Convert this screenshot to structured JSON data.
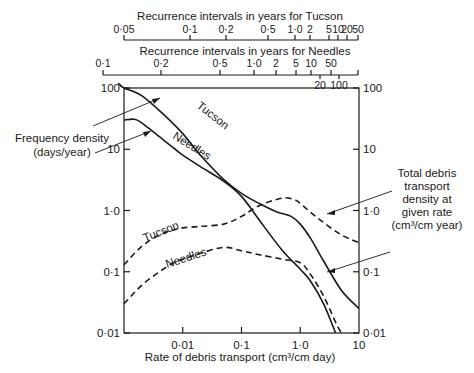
{
  "chart_data": {
    "type": "line",
    "title": "",
    "xlabel": "Rate of debris transport (cm³/cm day)",
    "ylabel_left": "Frequency density (days/year)",
    "ylabel_right": "Total debris transport density at given rate (cm³/cm year)",
    "xscale": "log",
    "yscale": "log",
    "xlim": [
      0.001,
      10
    ],
    "ylim": [
      0.01,
      100
    ],
    "grid": false,
    "x_ticks": [
      {
        "value": 0.01,
        "label": "0·01"
      },
      {
        "value": 0.1,
        "label": "0·1"
      },
      {
        "value": 1.0,
        "label": "1·0"
      },
      {
        "value": 10,
        "label": "10"
      }
    ],
    "y_ticks_left": [
      {
        "value": 100,
        "label": "100"
      },
      {
        "value": 10,
        "label": "10"
      },
      {
        "value": 1.0,
        "label": "1·0"
      },
      {
        "value": 0.1,
        "label": "0·1"
      },
      {
        "value": 0.01,
        "label": "0·01"
      }
    ],
    "y_ticks_right": [
      {
        "value": 100,
        "label": "100"
      },
      {
        "value": 10,
        "label": "10"
      },
      {
        "value": 1.0,
        "label": "1·0"
      },
      {
        "value": 0.1,
        "label": "0·1"
      },
      {
        "value": 0.01,
        "label": "0·01"
      }
    ],
    "top_axes": [
      {
        "title": "Recurrence intervals in years for Tucson",
        "ticks": [
          {
            "label": "0·05",
            "x": 124
          },
          {
            "label": "0·1",
            "x": 190
          },
          {
            "label": "0·2",
            "x": 226
          },
          {
            "label": "0·5",
            "x": 268
          },
          {
            "label": "1·0",
            "x": 295
          },
          {
            "label": "2",
            "x": 310
          },
          {
            "label": "5",
            "x": 329
          },
          {
            "label": "10",
            "x": 338
          },
          {
            "label": "20",
            "x": 347
          },
          {
            "label": "50",
            "x": 358
          }
        ]
      },
      {
        "title": "Recurrence intervals in years for Needles",
        "ticks": [
          {
            "label": "0·1",
            "x": 103,
            "pos": "above"
          },
          {
            "label": "0·2",
            "x": 161,
            "pos": "above"
          },
          {
            "label": "0·5",
            "x": 220,
            "pos": "above"
          },
          {
            "label": "1·0",
            "x": 254,
            "pos": "above"
          },
          {
            "label": "2",
            "x": 276,
            "pos": "above"
          },
          {
            "label": "5",
            "x": 296,
            "pos": "above"
          },
          {
            "label": "10",
            "x": 311,
            "pos": "above"
          },
          {
            "label": "20",
            "x": 320,
            "pos": "below"
          },
          {
            "label": "50",
            "x": 331,
            "pos": "above"
          },
          {
            "label": "100",
            "x": 339,
            "pos": "below"
          }
        ]
      }
    ],
    "series": [
      {
        "name": "Tucson",
        "group": "Frequency density",
        "style": "solid",
        "points": [
          [
            0.0008,
            120
          ],
          [
            0.001,
            100
          ],
          [
            0.002,
            75
          ],
          [
            0.005,
            35
          ],
          [
            0.01,
            18
          ],
          [
            0.02,
            8
          ],
          [
            0.05,
            3.2
          ],
          [
            0.1,
            1.9
          ],
          [
            0.2,
            1.3
          ],
          [
            0.4,
            0.95
          ],
          [
            0.7,
            0.8
          ],
          [
            1.0,
            0.6
          ],
          [
            1.5,
            0.35
          ],
          [
            2.5,
            0.15
          ],
          [
            5,
            0.05
          ],
          [
            10,
            0.025
          ]
        ]
      },
      {
        "name": "Needles",
        "group": "Frequency density",
        "style": "solid",
        "points": [
          [
            0.001,
            30
          ],
          [
            0.0015,
            31
          ],
          [
            0.002,
            27
          ],
          [
            0.004,
            16
          ],
          [
            0.007,
            10.5
          ],
          [
            0.01,
            8
          ],
          [
            0.02,
            5.2
          ],
          [
            0.05,
            3
          ],
          [
            0.1,
            1.7
          ],
          [
            0.2,
            0.7
          ],
          [
            0.5,
            0.22
          ],
          [
            1.0,
            0.11
          ],
          [
            1.5,
            0.07
          ],
          [
            2.5,
            0.03
          ],
          [
            4,
            0.01
          ]
        ]
      },
      {
        "name": "Tucson",
        "group": "Total debris transport density",
        "style": "dashed",
        "points": [
          [
            0.001,
            0.13
          ],
          [
            0.002,
            0.26
          ],
          [
            0.004,
            0.4
          ],
          [
            0.007,
            0.48
          ],
          [
            0.01,
            0.52
          ],
          [
            0.02,
            0.55
          ],
          [
            0.05,
            0.6
          ],
          [
            0.1,
            0.8
          ],
          [
            0.2,
            1.2
          ],
          [
            0.5,
            1.6
          ],
          [
            0.8,
            1.5
          ],
          [
            1.0,
            1.3
          ],
          [
            2,
            0.75
          ],
          [
            5,
            0.4
          ],
          [
            10,
            0.3
          ]
        ]
      },
      {
        "name": "Needles",
        "group": "Total debris transport density",
        "style": "dashed",
        "points": [
          [
            0.001,
            0.03
          ],
          [
            0.002,
            0.06
          ],
          [
            0.004,
            0.1
          ],
          [
            0.007,
            0.14
          ],
          [
            0.01,
            0.16
          ],
          [
            0.02,
            0.2
          ],
          [
            0.05,
            0.25
          ],
          [
            0.1,
            0.22
          ],
          [
            0.2,
            0.19
          ],
          [
            0.5,
            0.16
          ],
          [
            1.0,
            0.14
          ],
          [
            1.5,
            0.09
          ],
          [
            2.5,
            0.04
          ],
          [
            4,
            0.015
          ],
          [
            5,
            0.01
          ]
        ]
      }
    ],
    "annotations": {
      "left_label_line1": "Frequency density",
      "left_label_line2": "(days/year)",
      "right_label_lines": [
        "Total debris",
        "transport",
        "density at",
        "given rate",
        "(cm³/cm year)"
      ],
      "curve_labels": [
        {
          "text": "Tucson",
          "x": 196,
          "y": 107,
          "rotate": 38
        },
        {
          "text": "Needles",
          "x": 172,
          "y": 138,
          "rotate": 32
        },
        {
          "text": "Tucson",
          "x": 145,
          "y": 242,
          "rotate": -22
        },
        {
          "text": "Needles",
          "x": 167,
          "y": 268,
          "rotate": -18
        }
      ]
    }
  }
}
